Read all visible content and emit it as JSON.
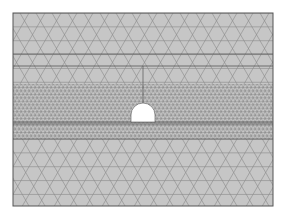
{
  "diagram": {
    "type": "finite-element-mesh",
    "colors": {
      "background": "#ffffff",
      "domain_fill": "#c6c6c6",
      "mesh_line": "#8a8a8a",
      "dense_line": "#6e6e6e",
      "boundary_line": "#555555",
      "opening_fill": "#ffffff"
    },
    "domain": {
      "x": 13,
      "y": 13,
      "width": 260,
      "height": 193
    },
    "horizontal_lines_y": [
      54,
      66,
      122,
      124,
      139
    ],
    "dense_band": {
      "y_top": 84,
      "y_bottom": 139
    },
    "vertical_line": {
      "x": 143,
      "y_top": 66,
      "y_bottom": 103
    },
    "opening": {
      "x_left": 131,
      "x_right": 155,
      "y_top": 103,
      "y_bottom": 122,
      "shape": "horseshoe"
    },
    "coarse_spacing": 16,
    "fine_spacing": 4
  }
}
